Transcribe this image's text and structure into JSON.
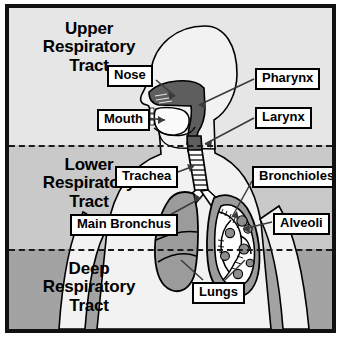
{
  "figure": {
    "background_color": "#ffffff",
    "frame_color": "#111111"
  },
  "bands": [
    {
      "id": "upper",
      "label": "Upper\nRespiratory\nTract",
      "color": "#e6e6e6",
      "top": 0,
      "height": 137
    },
    {
      "id": "lower",
      "label": "Lower\nRespiratory\nTract",
      "color": "#c9c9c9",
      "top": 137,
      "height": 104
    },
    {
      "id": "deep",
      "label": "Deep\nRespiratory\nTract",
      "color": "#a3a3a3",
      "top": 241,
      "height": 84
    }
  ],
  "dividers": [
    {
      "id": "upper-lower",
      "y": 137,
      "style": "dashed"
    },
    {
      "id": "lower-deep",
      "y": 241,
      "style": "dashed"
    }
  ],
  "callouts": [
    {
      "id": "nose",
      "label": "Nose",
      "left": 98,
      "top": 57
    },
    {
      "id": "mouth",
      "label": "Mouth",
      "left": 88,
      "top": 101
    },
    {
      "id": "pharynx",
      "label": "Pharynx",
      "left": 246,
      "top": 60
    },
    {
      "id": "larynx",
      "label": "Larynx",
      "left": 246,
      "top": 99
    },
    {
      "id": "trachea",
      "label": "Trachea",
      "left": 106,
      "top": 158
    },
    {
      "id": "bronchioles",
      "label": "Bronchioles",
      "left": 243,
      "top": 158
    },
    {
      "id": "main-bronchus",
      "label": "Main Bronchus",
      "left": 61,
      "top": 206
    },
    {
      "id": "alveoli",
      "label": "Alveoli",
      "left": 264,
      "top": 205
    },
    {
      "id": "lungs",
      "label": "Lungs",
      "left": 183,
      "top": 274
    }
  ],
  "anatomy": {
    "body_color": "#f2f2f2",
    "airway_color": "#5e5e5e",
    "lung_color": "#9b9b9b",
    "cavity_color": "#fbfbfb",
    "outline_color": "#000000",
    "parts": [
      "head-profile",
      "nasal-cavity",
      "pharynx",
      "oral-cavity",
      "larynx",
      "trachea",
      "main-bronchus",
      "left-lung",
      "right-lung-cutaway",
      "bronchial-tree",
      "alveoli-clusters",
      "torso",
      "left-arm",
      "right-arm"
    ]
  }
}
